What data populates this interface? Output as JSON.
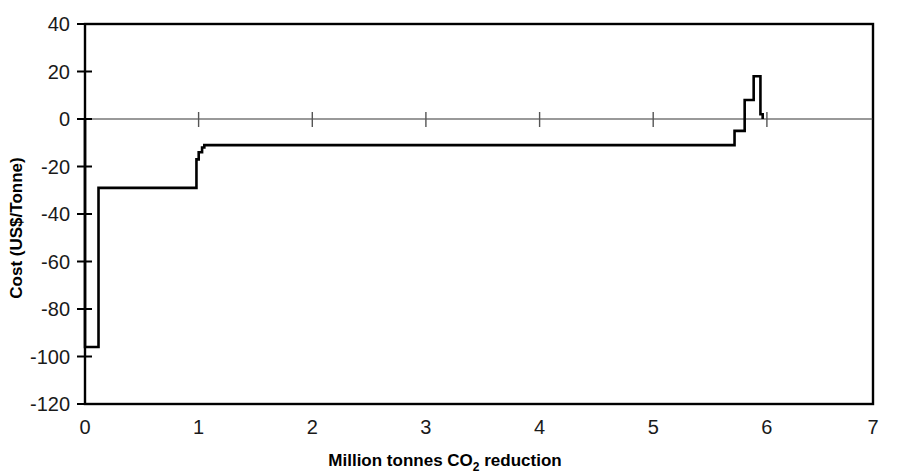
{
  "chart_data": {
    "type": "line",
    "title": "",
    "subtitle": "",
    "xlabel": "Million tonnes CO2 reduction",
    "xlabel_prefix": "Million tonnes CO",
    "xlabel_sub": "2",
    "xlabel_suffix": " reduction",
    "ylabel": "Cost (US$/Tonne)",
    "xlim": [
      0,
      7
    ],
    "ylim": [
      -120,
      40
    ],
    "xticks": [
      0,
      1,
      2,
      3,
      4,
      5,
      6,
      7
    ],
    "xtick_labels": [
      "0",
      "1",
      "2",
      "3",
      "4",
      "5",
      "6",
      "7"
    ],
    "yticks": [
      -120,
      -100,
      -80,
      -60,
      -40,
      -20,
      0,
      20,
      40
    ],
    "ytick_labels": [
      "-120",
      "-100",
      "-80",
      "-60",
      "-40",
      "-20",
      "0",
      "20",
      "40"
    ],
    "grid": false,
    "legend": false,
    "legend_position": "none",
    "series_name": "Marginal abatement cost curve",
    "line_color": "#000000",
    "zero_line_color": "#555555",
    "frame_color": "#000000",
    "steps": [
      {
        "x_start": 0.0,
        "x_end": 0.12,
        "cost": -96
      },
      {
        "x_start": 0.12,
        "x_end": 0.99,
        "cost": -29
      },
      {
        "x_start": 0.99,
        "x_end": 1.01,
        "cost": -17
      },
      {
        "x_start": 1.01,
        "x_end": 1.04,
        "cost": -14
      },
      {
        "x_start": 1.04,
        "x_end": 1.06,
        "cost": -12
      },
      {
        "x_start": 1.06,
        "x_end": 5.77,
        "cost": -11
      },
      {
        "x_start": 5.77,
        "x_end": 5.86,
        "cost": -5
      },
      {
        "x_start": 5.86,
        "x_end": 5.94,
        "cost": 8
      },
      {
        "x_start": 5.94,
        "x_end": 6.0,
        "cost": 18
      },
      {
        "x_start": 6.0,
        "x_end": 6.02,
        "cost": 2
      }
    ],
    "x": [
      0.0,
      0.12,
      0.99,
      1.01,
      1.04,
      1.06,
      5.77,
      5.86,
      5.94,
      6.0,
      6.02
    ],
    "y": [
      -96,
      -29,
      -17,
      -14,
      -12,
      -11,
      -5,
      8,
      18,
      2,
      2
    ],
    "annotations": []
  }
}
